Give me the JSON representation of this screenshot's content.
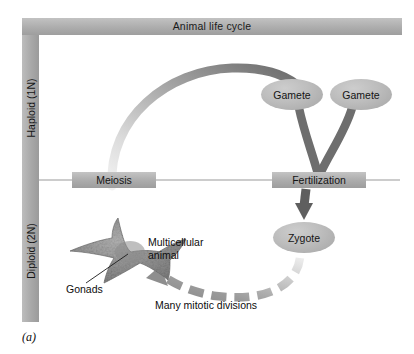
{
  "figure": {
    "caption": "(a)",
    "header": {
      "title": "Animal life cycle"
    },
    "axes": [
      {
        "key": "haploid",
        "label": "Haploid (1N)"
      },
      {
        "key": "diploid",
        "label": "Diploid (2N)"
      }
    ],
    "processes": [
      {
        "key": "meiosis",
        "label": "Meiosis"
      },
      {
        "key": "fertilization",
        "label": "Fertilization"
      }
    ],
    "cells": [
      {
        "key": "gamete_left",
        "label": "Gamete"
      },
      {
        "key": "gamete_right",
        "label": "Gamete"
      },
      {
        "key": "zygote",
        "label": "Zygote"
      }
    ],
    "annotations": [
      {
        "key": "multicellular",
        "label": "Multicellular\nanimal"
      },
      {
        "key": "gonads",
        "label": "Gonads"
      },
      {
        "key": "mitotic",
        "label": "Many mitotic divisions"
      }
    ],
    "colors": {
      "bar_gray": "#a8a8a8",
      "arrow_dark": "#6e6e6e",
      "arrow_light": "#e2e2e2",
      "organism_gray": "#8f8f8f",
      "divider": "#9a9a9a",
      "text": "#111111"
    }
  }
}
